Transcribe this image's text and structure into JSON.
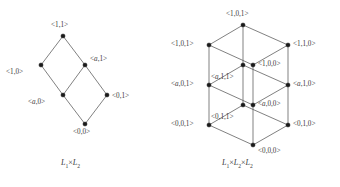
{
  "figure": {
    "type": "hasse-diagram-pair",
    "background_color": "#ffffff",
    "node_color": "#1a1a1a",
    "edge_color": "#4a4a4a",
    "text_color": "#3a3a3a"
  },
  "diagrams": [
    {
      "id": "left",
      "caption_html": "L<sub>1</sub><span class=\"times\">×</span>L<sub>2</sub>",
      "caption_text": "L1×L2",
      "caption_x": 61,
      "caption_y": 158,
      "nodes": [
        {
          "id": "n11",
          "label": "<1,1>",
          "html": "&lt;1,1&gt;",
          "x": 63,
          "y": 36,
          "label_x": 51,
          "label_y": 22,
          "label_align": "center"
        },
        {
          "id": "n10",
          "label": "<1,0>",
          "html": "&lt;1,0&gt;",
          "x": 41,
          "y": 65,
          "label_x": 6,
          "label_y": 69,
          "label_align": "right"
        },
        {
          "id": "na1",
          "label": "<a,1>",
          "html": "&lt;<span class=\"var\">a</span>,1&gt;",
          "x": 85,
          "y": 65,
          "label_x": 90,
          "label_y": 56,
          "label_align": "left"
        },
        {
          "id": "na0",
          "label": "<a,0>",
          "html": "&lt;<span class=\"var\">a</span>,0&gt;",
          "x": 63,
          "y": 95,
          "label_x": 28,
          "label_y": 99,
          "label_align": "right"
        },
        {
          "id": "n01",
          "label": "<0,1>",
          "html": "&lt;0,1&gt;",
          "x": 107,
          "y": 95,
          "label_x": 112,
          "label_y": 93,
          "label_align": "left"
        },
        {
          "id": "n00",
          "label": "<0,0>",
          "html": "&lt;0,0&gt;",
          "x": 85,
          "y": 124,
          "label_x": 73,
          "label_y": 129,
          "label_align": "center"
        }
      ],
      "edges": [
        [
          "n11",
          "n10"
        ],
        [
          "n11",
          "na1"
        ],
        [
          "n10",
          "na0"
        ],
        [
          "na1",
          "na0"
        ],
        [
          "na1",
          "n01"
        ],
        [
          "na0",
          "n00"
        ],
        [
          "n01",
          "n00"
        ]
      ]
    },
    {
      "id": "right",
      "caption_html": "L<sub>1</sub><span class=\"times\">×</span>L<sub>2</sub><span class=\"times\">×</span>L<sub>2</sub>",
      "caption_text": "L1×L2×L2",
      "caption_x": 222,
      "caption_y": 158,
      "nodes": [
        {
          "id": "t_top",
          "label": "<1,0,1>",
          "html": "&lt;1,0,1&gt;",
          "x": 243,
          "y": 25,
          "label_x": 226,
          "label_y": 11,
          "label_align": "center"
        },
        {
          "id": "t_left",
          "label": "<1,0,1>",
          "html": "&lt;1,0,1&gt;",
          "x": 209,
          "y": 45,
          "label_x": 171,
          "label_y": 41,
          "label_align": "right"
        },
        {
          "id": "t_right",
          "label": "<1,1,0>",
          "html": "&lt;1,1,0&gt;",
          "x": 288,
          "y": 45,
          "label_x": 293,
          "label_y": 41,
          "label_align": "left"
        },
        {
          "id": "t_ctr",
          "label": "<1,0,0>",
          "html": "&lt;1,0,0&gt;",
          "x": 253,
          "y": 65,
          "label_x": 258,
          "label_y": 61,
          "label_align": "left"
        },
        {
          "id": "m_top",
          "label": "<a,1,1>",
          "html": "&lt;<span class=\"var\">a</span>,1,1&gt;",
          "x": 243,
          "y": 65,
          "label_x": 211,
          "label_y": 74,
          "label_align": "left"
        },
        {
          "id": "m_left",
          "label": "<a,0,1>",
          "html": "&lt;<span class=\"var\">a</span>,0,1&gt;",
          "x": 209,
          "y": 85,
          "label_x": 171,
          "label_y": 81,
          "label_align": "right"
        },
        {
          "id": "m_right",
          "label": "<a,1,0>",
          "html": "&lt;<span class=\"var\">a</span>,1,0&gt;",
          "x": 288,
          "y": 85,
          "label_x": 293,
          "label_y": 81,
          "label_align": "left"
        },
        {
          "id": "m_ctr",
          "label": "<a,0,0>",
          "html": "&lt;<span class=\"var\">a</span>,0,0&gt;",
          "x": 253,
          "y": 105,
          "label_x": 258,
          "label_y": 101,
          "label_align": "left"
        },
        {
          "id": "b_top",
          "label": "<0,1,1>",
          "html": "&lt;0,1,1&gt;",
          "x": 243,
          "y": 105,
          "label_x": 211,
          "label_y": 114,
          "label_align": "left"
        },
        {
          "id": "b_left",
          "label": "<0,0,1>",
          "html": "&lt;0,0,1&gt;",
          "x": 209,
          "y": 125,
          "label_x": 171,
          "label_y": 121,
          "label_align": "right"
        },
        {
          "id": "b_right",
          "label": "<0,1,0>",
          "html": "&lt;0,1,0&gt;",
          "x": 288,
          "y": 125,
          "label_x": 293,
          "label_y": 121,
          "label_align": "left"
        },
        {
          "id": "b_ctr",
          "label": "<0,0,0>",
          "html": "&lt;0,0,0&gt;",
          "x": 253,
          "y": 145,
          "label_x": 258,
          "label_y": 148,
          "label_align": "left"
        }
      ],
      "edges": [
        [
          "t_top",
          "t_left"
        ],
        [
          "t_top",
          "t_right"
        ],
        [
          "t_left",
          "t_ctr"
        ],
        [
          "t_right",
          "t_ctr"
        ],
        [
          "m_top",
          "m_left"
        ],
        [
          "m_top",
          "m_right"
        ],
        [
          "m_left",
          "m_ctr"
        ],
        [
          "m_right",
          "m_ctr"
        ],
        [
          "b_top",
          "b_left"
        ],
        [
          "b_top",
          "b_right"
        ],
        [
          "b_left",
          "b_ctr"
        ],
        [
          "b_right",
          "b_ctr"
        ],
        [
          "t_top",
          "m_top"
        ],
        [
          "t_left",
          "m_left"
        ],
        [
          "t_right",
          "m_right"
        ],
        [
          "t_ctr",
          "m_ctr"
        ],
        [
          "m_top",
          "b_top"
        ],
        [
          "m_left",
          "b_left"
        ],
        [
          "m_right",
          "b_right"
        ],
        [
          "m_ctr",
          "b_ctr"
        ]
      ]
    }
  ]
}
